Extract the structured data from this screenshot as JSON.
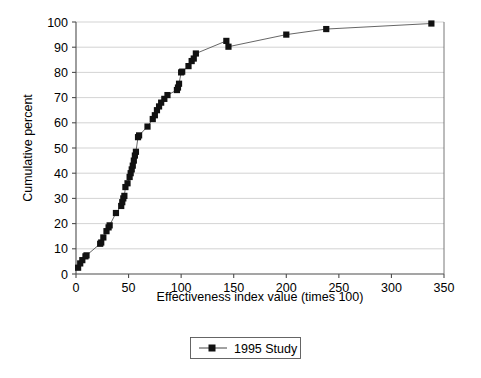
{
  "chart_data": {
    "type": "line",
    "title": "",
    "subtitle": "",
    "xlabel": "Effectiveness index value (times 100)",
    "ylabel": "Cumulative percent",
    "xlim": [
      0,
      350
    ],
    "ylim": [
      0,
      100
    ],
    "xticks": [
      0,
      50,
      100,
      150,
      200,
      250,
      300,
      350
    ],
    "yticks": [
      0,
      10,
      20,
      30,
      40,
      50,
      60,
      70,
      80,
      90,
      100
    ],
    "xtick_labels": [
      "0",
      "50",
      "100",
      "150",
      "200",
      "250",
      "300",
      "350"
    ],
    "ytick_labels": [
      "0",
      "10",
      "20",
      "30",
      "40",
      "50",
      "60",
      "70",
      "80",
      "90",
      "100"
    ],
    "grid": "horizontal",
    "legend_position": "below-plot-center",
    "marker": "square",
    "marker_color": "#111111",
    "line_color": "#555555",
    "grid_color": "#c8c8c8",
    "series": [
      {
        "name": "1995 Study",
        "points": [
          [
            2,
            2.5
          ],
          [
            4,
            4.2
          ],
          [
            6,
            5.5
          ],
          [
            9,
            7.0
          ],
          [
            10,
            7.4
          ],
          [
            23,
            12.0
          ],
          [
            24,
            12.5
          ],
          [
            26,
            14.5
          ],
          [
            29,
            17.0
          ],
          [
            31,
            18.5
          ],
          [
            32,
            19.3
          ],
          [
            38,
            24.2
          ],
          [
            43,
            27.0
          ],
          [
            44,
            28.5
          ],
          [
            45,
            30.0
          ],
          [
            46,
            31.0
          ],
          [
            47,
            34.5
          ],
          [
            49,
            36.0
          ],
          [
            51,
            38.5
          ],
          [
            52,
            40.0
          ],
          [
            53,
            41.5
          ],
          [
            54,
            43.0
          ],
          [
            55,
            45.0
          ],
          [
            56,
            47.0
          ],
          [
            57,
            48.5
          ],
          [
            59,
            54.3
          ],
          [
            60,
            55.0
          ],
          [
            68,
            58.5
          ],
          [
            73,
            61.5
          ],
          [
            75,
            63.0
          ],
          [
            77,
            65.0
          ],
          [
            79,
            66.5
          ],
          [
            81,
            68.0
          ],
          [
            84,
            69.5
          ],
          [
            87,
            71.0
          ],
          [
            96,
            73.0
          ],
          [
            97,
            74.0
          ],
          [
            98,
            75.5
          ],
          [
            100,
            80.0
          ],
          [
            101,
            80.3
          ],
          [
            107,
            82.5
          ],
          [
            110,
            84.5
          ],
          [
            112,
            85.5
          ],
          [
            114,
            87.5
          ],
          [
            143,
            92.5
          ],
          [
            145,
            90.2
          ],
          [
            200,
            95.0
          ],
          [
            238,
            97.2
          ],
          [
            338,
            99.4
          ]
        ]
      }
    ]
  },
  "legend": {
    "entries": [
      {
        "label": "1995 Study"
      }
    ]
  }
}
